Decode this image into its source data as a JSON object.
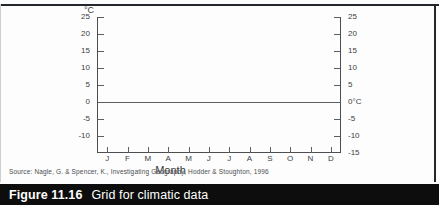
{
  "chart_data": {
    "type": "line",
    "title": "",
    "xlabel": "Month",
    "ylabel": "°C",
    "ylim": [
      -15,
      25
    ],
    "xlim": [
      0,
      12
    ],
    "grid": false,
    "legend": null,
    "series": [],
    "note": "Empty grid / blank template for plotting climatic data — no data points drawn.",
    "categories": [
      "J",
      "F",
      "M",
      "A",
      "M",
      "J",
      "J",
      "A",
      "S",
      "O",
      "N",
      "D"
    ],
    "y_ticks_left": [
      "25",
      "20",
      "15",
      "10",
      "5",
      "0",
      "-5",
      "-10"
    ],
    "y_ticks_right": [
      "25",
      "20",
      "15",
      "10",
      "5",
      "0°C",
      "-5",
      "-10",
      "-15"
    ],
    "y_tick_values": [
      25,
      20,
      15,
      10,
      5,
      0,
      -5,
      -10,
      -15
    ],
    "zero_line": 0
  },
  "axes": {
    "unit_label": "°C",
    "x_axis_title": "Month",
    "zero_right_label": "0°C"
  },
  "source": {
    "text": "Source: Nagle, G. & Spencer, K., Investigating Geography, Hodder & Stoughton, 1996"
  },
  "caption": {
    "number": "Figure 11.16",
    "title": "Grid for climatic data"
  },
  "colors": {
    "caption_bar": "#0d0d0d",
    "caption_text": "#ffffff",
    "axis": "#4b4f52",
    "frame": "#23272b",
    "page": "#ffffff"
  }
}
